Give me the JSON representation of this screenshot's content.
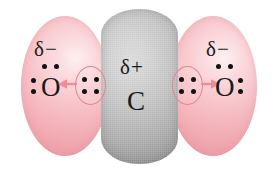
{
  "figure": {
    "molecule": "CO2"
  },
  "colors": {
    "oxygen_cloud": "#f4b4bb",
    "carbon_cloud": "#bdbdbd",
    "arrow": "#ef8b95",
    "ellipse_outline": "#e3878f",
    "text": "#1a1a1a",
    "background": "#ffffff"
  },
  "atoms": {
    "oxygen_left": {
      "symbol": "O",
      "charge_label": "δ−",
      "lone_pairs": 2
    },
    "carbon": {
      "symbol": "C",
      "charge_label": "δ+"
    },
    "oxygen_right": {
      "symbol": "O",
      "charge_label": "δ−",
      "lone_pairs": 2
    }
  },
  "bonds": {
    "left": {
      "electrons": 4,
      "arrow_direction": "left"
    },
    "right": {
      "electrons": 4,
      "arrow_direction": "right"
    }
  }
}
